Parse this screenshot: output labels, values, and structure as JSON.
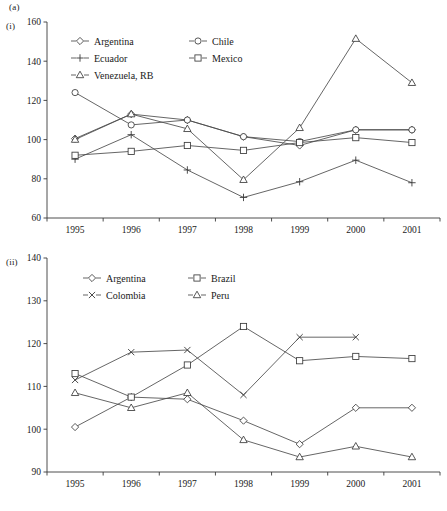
{
  "figure": {
    "panel_label": "(a)",
    "subpanel_i_label": "(i)",
    "subpanel_ii_label": "(ii)"
  },
  "chart_data": [
    {
      "type": "line",
      "panel": "(i)",
      "title": "",
      "xlabel": "",
      "ylabel": "",
      "categories": [
        "1995",
        "1996",
        "1997",
        "1998",
        "1999",
        "2000",
        "2001"
      ],
      "x": [
        1995,
        1996,
        1997,
        1998,
        1999,
        2000,
        2001
      ],
      "ylim": [
        60,
        160
      ],
      "yticks": [
        60,
        80,
        100,
        120,
        140,
        160
      ],
      "ytick_labels": [
        "60",
        "80",
        "100",
        "120",
        "140",
        "160"
      ],
      "grid": false,
      "legend_position": "top-left-inside",
      "series": [
        {
          "name": "Argentina",
          "marker": "diamond",
          "values": [
            100.5,
            113.0,
            110.0,
            101.5,
            97.0,
            105.0,
            105.0
          ]
        },
        {
          "name": "Chile",
          "marker": "circle",
          "values": [
            124.0,
            107.5,
            110.0,
            101.5,
            99.0,
            105.0,
            105.0
          ]
        },
        {
          "name": "Ecuador",
          "marker": "plus",
          "values": [
            90.0,
            102.5,
            84.5,
            70.5,
            78.5,
            89.5,
            78.0
          ]
        },
        {
          "name": "Mexico",
          "marker": "square",
          "values": [
            92.0,
            94.0,
            97.0,
            94.5,
            98.5,
            101.0,
            98.5
          ]
        },
        {
          "name": "Venezuela, RB",
          "marker": "triangle",
          "values": [
            100.0,
            113.0,
            105.5,
            79.5,
            106.0,
            151.5,
            129.0
          ]
        }
      ]
    },
    {
      "type": "line",
      "panel": "(ii)",
      "title": "",
      "xlabel": "",
      "ylabel": "",
      "categories": [
        "1995",
        "1996",
        "1997",
        "1998",
        "1999",
        "2000",
        "2001"
      ],
      "x": [
        1995,
        1996,
        1997,
        1998,
        1999,
        2000,
        2001
      ],
      "ylim": [
        90,
        140
      ],
      "yticks": [
        90,
        100,
        110,
        120,
        130,
        140
      ],
      "ytick_labels": [
        "90",
        "100",
        "110",
        "120",
        "130",
        "140"
      ],
      "grid": false,
      "legend_position": "top-left-inside",
      "series": [
        {
          "name": "Argentina",
          "marker": "diamond",
          "values": [
            100.5,
            107.5,
            107.0,
            102.0,
            96.5,
            105.0,
            105.0
          ]
        },
        {
          "name": "Brazil",
          "marker": "square",
          "values": [
            113.0,
            107.5,
            115.0,
            124.0,
            116.0,
            117.0,
            116.5
          ]
        },
        {
          "name": "Colombia",
          "marker": "cross",
          "values": [
            111.5,
            118.0,
            118.5,
            108.0,
            121.5,
            121.5,
            null
          ]
        },
        {
          "name": "Peru",
          "marker": "triangle",
          "values": [
            108.5,
            105.0,
            108.5,
            97.5,
            93.5,
            96.0,
            93.5
          ]
        }
      ]
    }
  ],
  "legends": {
    "chart_i": [
      {
        "label": "Argentina",
        "marker": "diamond"
      },
      {
        "label": "Chile",
        "marker": "circle"
      },
      {
        "label": "Ecuador",
        "marker": "plus"
      },
      {
        "label": "Mexico",
        "marker": "square"
      },
      {
        "label": "Venezuela, RB",
        "marker": "triangle"
      }
    ],
    "chart_ii": [
      {
        "label": "Argentina",
        "marker": "diamond"
      },
      {
        "label": "Brazil",
        "marker": "square"
      },
      {
        "label": "Colombia",
        "marker": "cross"
      },
      {
        "label": "Peru",
        "marker": "triangle"
      }
    ]
  },
  "colors": {
    "line": "#4a4a4a",
    "axis": "#3a3a3a",
    "text": "#1a1a1a",
    "marker_fill": "#ffffff"
  }
}
